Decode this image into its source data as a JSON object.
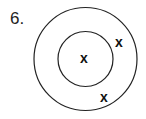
{
  "problem": {
    "number_label": "6."
  },
  "diagram": {
    "outer_circle": {
      "cx": 85.5,
      "cy": 59,
      "r": 51.5
    },
    "inner_circle": {
      "cx": 85.5,
      "cy": 59,
      "r": 27.5
    },
    "marks": [
      {
        "label": "x",
        "x": 84,
        "y": 58
      },
      {
        "label": "x",
        "x": 119,
        "y": 42
      },
      {
        "label": "x",
        "x": 104,
        "y": 97
      }
    ],
    "stroke_color": "#222222"
  }
}
